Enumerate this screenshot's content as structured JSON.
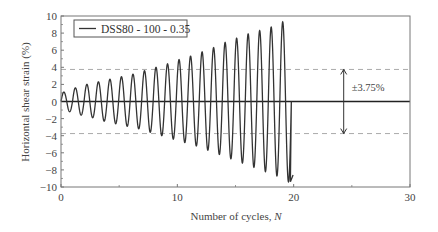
{
  "chart_data": {
    "type": "line",
    "title": "",
    "xlabel": "Number of cycles, N",
    "xlabel_main": "Number of cycles, ",
    "xlabel_italic": "N",
    "ylabel": "Horizontal shear strain (%)",
    "xlim": [
      0,
      30
    ],
    "ylim": [
      -10,
      10
    ],
    "xticks": [
      0,
      10,
      20,
      30
    ],
    "xtick_labels": [
      "0",
      "10",
      "20",
      "30"
    ],
    "yticks": [
      10,
      8,
      6,
      4,
      2,
      0,
      -2,
      -4,
      -6,
      -8,
      -10
    ],
    "ytick_labels": [
      "10",
      "8",
      "6",
      "4",
      "2",
      "0",
      "−2",
      "−4",
      "−6",
      "−8",
      "−10"
    ],
    "grid": false,
    "legend_position": "upper-left",
    "series": [
      {
        "name": "DSS80 - 100 - 0.35",
        "color": "#333333",
        "cycles": 20,
        "peaks": [
          1.1,
          1.6,
          2.0,
          2.3,
          2.6,
          2.9,
          3.2,
          3.6,
          4.0,
          4.4,
          4.9,
          5.3,
          5.8,
          6.3,
          6.9,
          7.4,
          7.9,
          8.3,
          8.7,
          9.3
        ],
        "troughs": [
          -1.2,
          -1.6,
          -1.9,
          -2.3,
          -2.6,
          -2.9,
          -3.2,
          -3.6,
          -4.0,
          -4.4,
          -4.8,
          -5.2,
          -5.7,
          -6.2,
          -6.7,
          -7.2,
          -7.7,
          -8.2,
          -8.7,
          -9.4
        ],
        "end_value": -8.6
      }
    ],
    "reference_lines": [
      {
        "y": 3.75,
        "style": "dashed",
        "color": "#aaaaaa"
      },
      {
        "y": -3.75,
        "style": "dashed",
        "color": "#aaaaaa"
      },
      {
        "y": 0,
        "style": "solid",
        "color": "#222222"
      }
    ],
    "annotations": [
      {
        "text": "±3.75%",
        "type": "double-arrow",
        "x": 24.3,
        "y_from": -3.75,
        "y_to": 3.75
      }
    ]
  }
}
